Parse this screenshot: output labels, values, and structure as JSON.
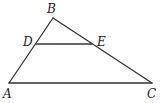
{
  "diagram": {
    "type": "triangle-with-parallel-segment",
    "points": {
      "A": {
        "x": 9,
        "y": 83,
        "label": "A",
        "lx": 3,
        "ly": 98
      },
      "B": {
        "x": 53,
        "y": 18,
        "label": "B",
        "lx": 47,
        "ly": 13
      },
      "C": {
        "x": 152,
        "y": 83,
        "label": "C",
        "lx": 147,
        "ly": 98
      },
      "D": {
        "x": 36,
        "y": 44,
        "label": "D",
        "lx": 23,
        "ly": 46
      },
      "E": {
        "x": 92,
        "y": 44,
        "label": "E",
        "lx": 97,
        "ly": 46
      }
    },
    "segments": [
      [
        "A",
        "B"
      ],
      [
        "B",
        "C"
      ],
      [
        "A",
        "C"
      ],
      [
        "D",
        "E"
      ]
    ],
    "stroke_color": "#333333",
    "background": "#ffffff"
  }
}
